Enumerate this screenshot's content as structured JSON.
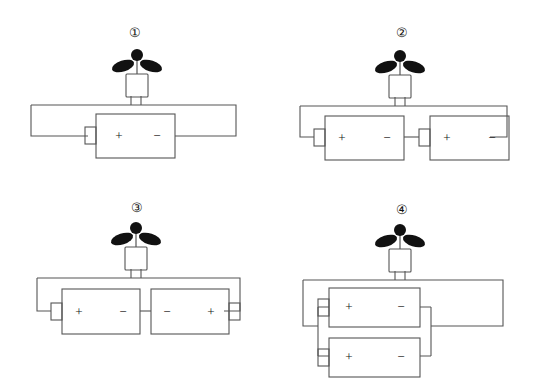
{
  "figure": {
    "background_color": "#ffffff",
    "line_color": "#555555",
    "ink_color": "#141414",
    "blade_color": "#111111"
  },
  "symbols": {
    "plus": "+",
    "minus": "−",
    "circled_one": "①",
    "circled_two": "②",
    "circled_three": "③",
    "circled_four": "④"
  },
  "panels": [
    {
      "id": "panel-1",
      "label": "①",
      "label_number": "1",
      "motor": {
        "name": "electric-motor-with-fan",
        "blades": 2,
        "position": "top-center"
      },
      "battery_arrangement": "single",
      "battery_count": 1,
      "batteries": [
        {
          "index": 1,
          "left_terminal": "+",
          "right_terminal": "−",
          "nub_side": "left",
          "row": 1
        }
      ]
    },
    {
      "id": "panel-2",
      "label": "②",
      "label_number": "2",
      "motor": {
        "name": "electric-motor-with-fan",
        "blades": 2,
        "position": "top-center"
      },
      "battery_arrangement": "series-aiding",
      "battery_count": 2,
      "batteries": [
        {
          "index": 1,
          "left_terminal": "+",
          "right_terminal": "−",
          "nub_side": "left",
          "row": 1
        },
        {
          "index": 2,
          "left_terminal": "+",
          "right_terminal": "−",
          "nub_side": "left",
          "row": 1
        }
      ]
    },
    {
      "id": "panel-3",
      "label": "③",
      "label_number": "3",
      "motor": {
        "name": "electric-motor-with-fan",
        "blades": 2,
        "position": "top-center"
      },
      "battery_arrangement": "series-opposing",
      "battery_count": 2,
      "batteries": [
        {
          "index": 1,
          "left_terminal": "+",
          "right_terminal": "−",
          "nub_side": "left",
          "row": 1
        },
        {
          "index": 2,
          "left_terminal": "−",
          "right_terminal": "+",
          "nub_side": "right",
          "row": 1
        }
      ]
    },
    {
      "id": "panel-4",
      "label": "④",
      "label_number": "4",
      "motor": {
        "name": "electric-motor-with-fan",
        "blades": 2,
        "position": "top-center"
      },
      "battery_arrangement": "parallel",
      "battery_count": 2,
      "batteries": [
        {
          "index": 1,
          "left_terminal": "+",
          "right_terminal": "−",
          "nub_side": "left",
          "row": 1
        },
        {
          "index": 2,
          "left_terminal": "+",
          "right_terminal": "−",
          "nub_side": "left",
          "row": 2
        }
      ]
    }
  ]
}
